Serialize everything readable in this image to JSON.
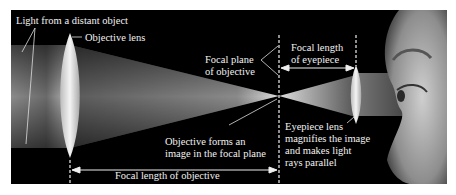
{
  "diagram": {
    "labels": {
      "light_source": "Light from a distant object",
      "objective_lens": "Objective lens",
      "focal_plane_line1": "Focal plane",
      "focal_plane_line2": "of objective",
      "focal_length_eyepiece_line1": "Focal length",
      "focal_length_eyepiece_line2": "of eyepiece",
      "objective_forms_line1": "Objective forms an",
      "objective_forms_line2": "image in the focal plane",
      "eyepiece_line1": "Eyepiece lens",
      "eyepiece_line2": "magnifies the image",
      "eyepiece_line3": "and makes light",
      "eyepiece_line4": "rays parallel",
      "focal_length_objective": "Focal length of objective"
    },
    "elements": [
      "light-beam",
      "objective-lens",
      "focal-point",
      "eyepiece-lens",
      "parallel-beam",
      "observer-eye"
    ],
    "colors": {
      "background": "#000000",
      "beam": "#9a9a9a",
      "lens": "#e6e6e6",
      "text": "#f2f2f2",
      "page": "#ffffff"
    }
  }
}
